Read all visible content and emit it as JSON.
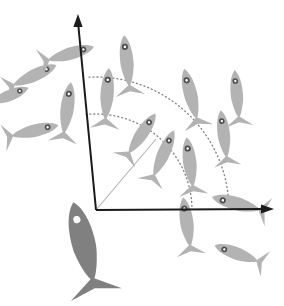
{
  "figure": {
    "type": "diagram",
    "canvas": {
      "width": 284,
      "height": 306
    },
    "background_color": "#ffffff"
  },
  "colors": {
    "focal_fish": "#808080",
    "focal_fish_eye": "#ffffff",
    "neighbor_fish": "#b3b3b3",
    "neighbor_fish_eye_ring": "#4d4d4d",
    "neighbor_fish_eye_center": "#ffffff",
    "axis": "#1a1a1a",
    "arc": "#808080",
    "radial_line": "#b3b3b3"
  },
  "geometry": {
    "origin": {
      "x": 96,
      "y": 210
    },
    "vertical_axis": {
      "label": "heading-axis",
      "from": {
        "x": 96,
        "y": 210
      },
      "to": {
        "x": 78,
        "y": 22
      },
      "arrowhead": {
        "x": 78,
        "y": 14
      },
      "stroke_width": 2
    },
    "horizontal_axis": {
      "label": "lateral-axis",
      "from": {
        "x": 96,
        "y": 210
      },
      "to": {
        "x": 264,
        "y": 209
      },
      "arrowhead": {
        "x": 274,
        "y": 209
      },
      "stroke_width": 2
    },
    "radial_line": {
      "label": "neighbor-bearing-line",
      "from": {
        "x": 96,
        "y": 210
      },
      "to": {
        "x": 156,
        "y": 139
      },
      "stroke_width": 1
    },
    "arcs": [
      {
        "name": "inner-range-arc",
        "radius": 96,
        "start_angle_deg": 96,
        "end_angle_deg": 1,
        "dash": "1 3",
        "stroke_width": 1.3
      },
      {
        "name": "outer-range-arc",
        "radius": 133,
        "start_angle_deg": 93,
        "end_angle_deg": 1,
        "dash": "1 3",
        "stroke_width": 1.3
      }
    ]
  },
  "focal_fish": {
    "name": "focal-fish",
    "x": 84,
    "y": 245,
    "length": 88,
    "width": 25,
    "rotation_deg": 104,
    "eye": {
      "offset": 0.33,
      "radius": 2.6
    }
  },
  "neighbor_fish": [
    {
      "id": 1,
      "x": 33,
      "y": 76,
      "length": 52,
      "width": 13,
      "rotation_deg": 25
    },
    {
      "id": 2,
      "x": 33,
      "y": 131,
      "length": 52,
      "width": 13,
      "rotation_deg": 13
    },
    {
      "id": 3,
      "x": 69,
      "y": 54,
      "length": 52,
      "width": 13,
      "rotation_deg": 16
    },
    {
      "id": 4,
      "x": 67,
      "y": 110,
      "length": 56,
      "width": 14,
      "rotation_deg": 82
    },
    {
      "id": 5,
      "x": 107,
      "y": 96,
      "length": 56,
      "width": 14,
      "rotation_deg": 86
    },
    {
      "id": 6,
      "x": 127,
      "y": 63,
      "length": 56,
      "width": 14,
      "rotation_deg": 96
    },
    {
      "id": 7,
      "x": 141,
      "y": 135,
      "length": 52,
      "width": 13,
      "rotation_deg": 56
    },
    {
      "id": 8,
      "x": 163,
      "y": 155,
      "length": 54,
      "width": 13,
      "rotation_deg": 66
    },
    {
      "id": 9,
      "x": 191,
      "y": 96,
      "length": 56,
      "width": 14,
      "rotation_deg": 104
    },
    {
      "id": 10,
      "x": 190,
      "y": 164,
      "length": 54,
      "width": 14,
      "rotation_deg": 97
    },
    {
      "id": 11,
      "x": 237,
      "y": 96,
      "length": 52,
      "width": 13,
      "rotation_deg": 95
    },
    {
      "id": 12,
      "x": 224,
      "y": 136,
      "length": 52,
      "width": 13,
      "rotation_deg": 97
    },
    {
      "id": 13,
      "x": 187,
      "y": 224,
      "length": 54,
      "width": 14,
      "rotation_deg": 98
    },
    {
      "id": 14,
      "x": 238,
      "y": 204,
      "length": 54,
      "width": 14,
      "rotation_deg": 165
    },
    {
      "id": 15,
      "x": 238,
      "y": 254,
      "length": 50,
      "width": 13,
      "rotation_deg": 160
    },
    {
      "id": 16,
      "x": 8,
      "y": 96,
      "length": 44,
      "width": 12,
      "rotation_deg": 22
    }
  ]
}
